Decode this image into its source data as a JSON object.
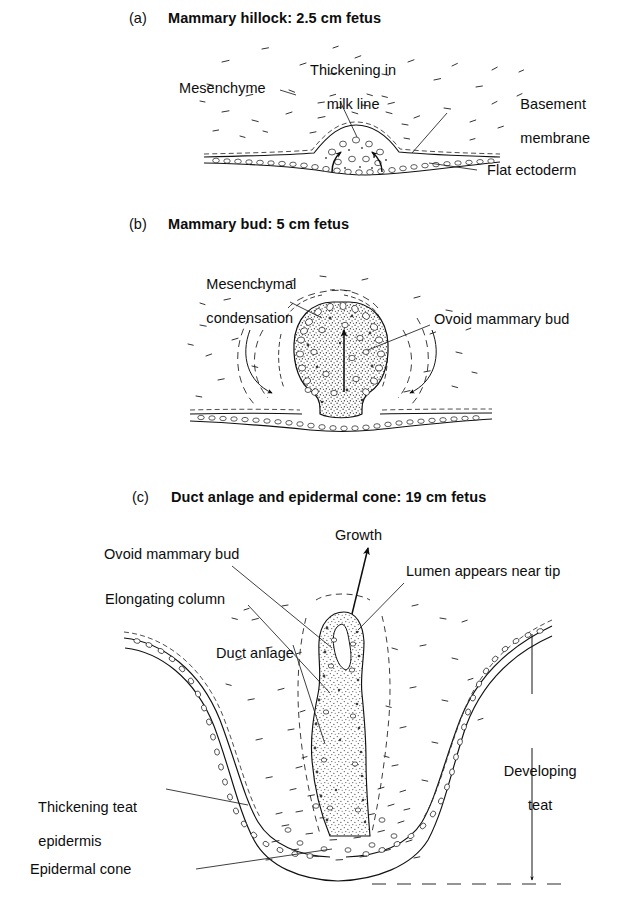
{
  "figure": {
    "kind": "scientific-illustration",
    "background_color": "#ffffff",
    "ink_color": "#111111"
  },
  "panels": [
    {
      "tag": "(a)",
      "title": "Mammary hillock: 2.5 cm fetus",
      "labels": [
        {
          "name": "mesenchyme",
          "text": "Mesenchyme"
        },
        {
          "name": "thickening-in-milk-line",
          "text": "Thickening in\nmilk line"
        },
        {
          "name": "basement-membrane",
          "text": "Basement\nmembrane"
        },
        {
          "name": "flat-ectoderm",
          "text": "Flat ectoderm"
        }
      ]
    },
    {
      "tag": "(b)",
      "title": "Mammary bud: 5 cm fetus",
      "labels": [
        {
          "name": "mesenchymal-condensation",
          "text": "Mesenchymal\ncondensation"
        },
        {
          "name": "ovoid-mammary-bud",
          "text": "Ovoid mammary bud"
        }
      ]
    },
    {
      "tag": "(c)",
      "title": "Duct anlage and epidermal cone: 19 cm fetus",
      "labels": [
        {
          "name": "growth",
          "text": "Growth"
        },
        {
          "name": "ovoid-mammary-bud",
          "text": "Ovoid mammary bud"
        },
        {
          "name": "lumen-appears-near-tip",
          "text": "Lumen appears near tip"
        },
        {
          "name": "elongating-column",
          "text": "Elongating column"
        },
        {
          "name": "duct-anlage",
          "text": "Duct anlage"
        },
        {
          "name": "developing-teat",
          "text": "Developing\nteat"
        },
        {
          "name": "thickening-teat-epidermis",
          "text": "Thickening teat\nepidermis"
        },
        {
          "name": "epidermal-cone",
          "text": "Epidermal cone"
        }
      ]
    }
  ],
  "panel_a": {
    "tag": "(a)",
    "title": "Mammary hillock: 2.5 cm fetus",
    "mesenchyme": "Mesenchyme",
    "milk_line_1": "Thickening in",
    "milk_line_2": "milk line",
    "basement_1": "Basement",
    "basement_2": "membrane",
    "flat_ectoderm": "Flat ectoderm"
  },
  "panel_b": {
    "tag": "(b)",
    "title": "Mammary bud: 5 cm fetus",
    "condensation_1": "Mesenchymal",
    "condensation_2": "condensation",
    "ovoid_bud": "Ovoid mammary bud"
  },
  "panel_c": {
    "tag": "(c)",
    "title": "Duct anlage and epidermal cone: 19 cm fetus",
    "growth": "Growth",
    "ovoid_bud": "Ovoid mammary bud",
    "lumen": "Lumen appears near tip",
    "elongating_column": "Elongating column",
    "duct_anlage": "Duct anlage",
    "developing_teat_1": "Developing",
    "developing_teat_2": "teat",
    "thickening_1": "Thickening teat",
    "thickening_2": "epidermis",
    "epidermal_cone": "Epidermal cone"
  }
}
